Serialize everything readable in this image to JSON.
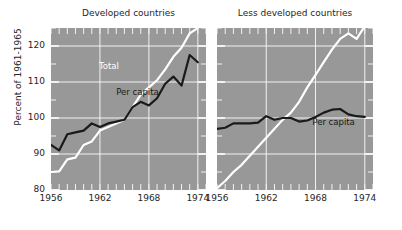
{
  "figure": {
    "ylabel": "Percent of 1961-1965",
    "background": "#ffffff",
    "plot_background": "#989898",
    "grid_color": "#f2f2f2",
    "total_color": "#ffffff",
    "percapita_color": "#1a1a1a"
  },
  "panels": [
    {
      "title": "Developed countries"
    },
    {
      "title": "Less developed countries"
    }
  ],
  "labels": {
    "total": "Total",
    "per_capita": "Per capita"
  },
  "chart_data": {
    "type": "line",
    "title": "",
    "xlabel": "",
    "ylabel": "Percent of 1961-1965",
    "xlim": [
      1956,
      1975
    ],
    "ylim": [
      80,
      125
    ],
    "yticks": [
      80,
      90,
      100,
      110,
      120
    ],
    "ytick_labels": [
      "80",
      "90",
      "100",
      "110",
      "120"
    ],
    "xticks": [
      1956,
      1962,
      1968,
      1974
    ],
    "xtick_labels": [
      "1956",
      "1962",
      "1968",
      "1974"
    ],
    "minor_ticks": "every 1 year",
    "grid": true,
    "legend": "inline annotations",
    "panels": [
      {
        "name": "Developed countries",
        "x": [
          1956,
          1957,
          1958,
          1959,
          1960,
          1961,
          1962,
          1963,
          1964,
          1965,
          1966,
          1967,
          1968,
          1969,
          1970,
          1971,
          1972,
          1973,
          1974
        ],
        "series": [
          {
            "name": "Total",
            "color": "#ffffff",
            "values": [
              85.0,
              85.2,
              88.5,
              89.0,
              92.5,
              93.5,
              96.5,
              97.5,
              98.5,
              99.5,
              103.0,
              106.5,
              108.5,
              110.5,
              113.5,
              117.0,
              119.5,
              123.5,
              125.0
            ]
          },
          {
            "name": "Per capita",
            "color": "#1a1a1a",
            "values": [
              92.5,
              91.0,
              95.5,
              96.0,
              96.5,
              98.5,
              97.5,
              98.5,
              99.0,
              99.5,
              103.0,
              104.5,
              103.5,
              105.5,
              109.5,
              111.5,
              109.0,
              117.5,
              115.5
            ]
          }
        ]
      },
      {
        "name": "Less developed countries",
        "x": [
          1956,
          1957,
          1958,
          1959,
          1960,
          1961,
          1962,
          1963,
          1964,
          1965,
          1966,
          1967,
          1968,
          1969,
          1970,
          1971,
          1972,
          1973,
          1974
        ],
        "series": [
          {
            "name": "Total",
            "color": "#ffffff",
            "values": [
              80.5,
              82.5,
              85.0,
              87.0,
              89.5,
              92.0,
              94.5,
              97.0,
              99.5,
              101.5,
              104.5,
              108.5,
              112.0,
              115.5,
              119.0,
              122.0,
              123.5,
              122.0,
              125.5
            ]
          },
          {
            "name": "Per capita",
            "color": "#1a1a1a",
            "values": [
              97.0,
              97.3,
              98.5,
              98.5,
              98.5,
              98.7,
              100.5,
              99.5,
              100.0,
              100.0,
              99.0,
              99.3,
              100.3,
              101.5,
              102.3,
              102.5,
              101.0,
              100.5,
              100.3
            ]
          }
        ]
      }
    ]
  }
}
